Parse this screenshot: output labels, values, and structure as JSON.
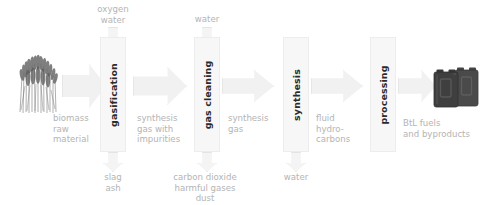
{
  "diagram": {
    "background_color": "#ffffff",
    "box_fill": "#f7f7f7",
    "arrow_fill": "#f1f1f1",
    "label_color": "#b4b4b4",
    "process_label_color": "#2b2b2b"
  },
  "stages": [
    {
      "id": "gasification",
      "label": "gasification"
    },
    {
      "id": "gas-cleaning",
      "label": "gas cleaning"
    },
    {
      "id": "synthesis",
      "label": "synthesis"
    },
    {
      "id": "processing",
      "label": "processing"
    }
  ],
  "inputs_top": [
    {
      "id": "oxygen-water",
      "label": "oxygen\nwater",
      "stage": "gasification"
    },
    {
      "id": "water-cleaning",
      "label": "water",
      "stage": "gas-cleaning"
    }
  ],
  "outputs_bottom": [
    {
      "id": "slag-ash",
      "label": "slag\nash",
      "stage": "gasification"
    },
    {
      "id": "co2-harmful-dust",
      "label": "carbon dioxide\nharmful gases\ndust",
      "stage": "gas-cleaning"
    },
    {
      "id": "water-synthesis",
      "label": "water",
      "stage": "synthesis"
    }
  ],
  "streams": [
    {
      "id": "biomass-raw-material",
      "label": "biomass\nraw\nmaterial"
    },
    {
      "id": "synthesis-gas-impurities",
      "label": "synthesis\ngas with\nimpurities"
    },
    {
      "id": "synthesis-gas",
      "label": "synthesis\ngas"
    },
    {
      "id": "fluid-hydrocarbons",
      "label": "fluid\nhydro-\ncarbons"
    },
    {
      "id": "btl-fuels",
      "label": "BtL fuels\nand byproducts"
    }
  ],
  "illustrations": [
    {
      "id": "biomass-crop",
      "name": "miscanthus-grass-illustration"
    },
    {
      "id": "fuel-canisters",
      "name": "jerry-can-illustration"
    }
  ]
}
